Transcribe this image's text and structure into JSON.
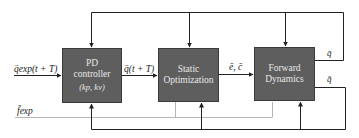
{
  "blocks": {
    "pd": {
      "line1": "PD",
      "line2": "controller",
      "params": "(kp, kv)"
    },
    "static_opt": {
      "line1": "Static",
      "line2": "Optimization"
    },
    "forward_dyn": {
      "line1": "Forward",
      "line2": "Dynamics"
    }
  },
  "signals": {
    "q_exp_input": "q̈exp(t + T)",
    "q_future": "q̈(t + T)",
    "e_c": "ē, c̄",
    "q_out": "q̄",
    "q_ddot_out": "q̈̄",
    "f_exp": "f̄exp"
  },
  "colors": {
    "block_fill": "#5e5e5e",
    "block_text": "#e8e8e8",
    "wire": "#222222",
    "f_exp_wire": "#b5b5b5"
  }
}
